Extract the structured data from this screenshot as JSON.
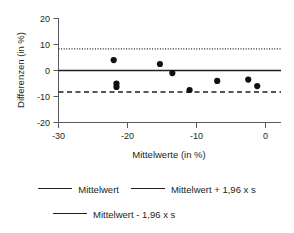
{
  "chart_data": {
    "type": "scatter",
    "title": "",
    "xlabel": "Mittelwerte (in %)",
    "ylabel": "Differenzen (in %)",
    "xlim": [
      -30,
      2
    ],
    "ylim": [
      -20,
      20
    ],
    "xticks": [
      "-30",
      "-20",
      "-10",
      "0"
    ],
    "xtick_values": [
      -30,
      -20,
      -10,
      0
    ],
    "yticks": [
      "20",
      "10",
      "0",
      "-10",
      "-20"
    ],
    "ytick_values": [
      20,
      10,
      0,
      -10,
      -20
    ],
    "grid": false,
    "legend_position": "bottom",
    "points": [
      {
        "x": -22.0,
        "y": 4.0
      },
      {
        "x": -21.6,
        "y": -5.0
      },
      {
        "x": -21.6,
        "y": -6.3
      },
      {
        "x": -15.3,
        "y": 2.5
      },
      {
        "x": -13.5,
        "y": -1.0
      },
      {
        "x": -11.0,
        "y": -7.5
      },
      {
        "x": -7.0,
        "y": -4.0
      },
      {
        "x": -2.5,
        "y": -3.5
      },
      {
        "x": -1.2,
        "y": -6.0
      }
    ],
    "reference_lines": [
      {
        "name": "mean",
        "value": 0.0,
        "style": "solid",
        "label": "Mittelwert"
      },
      {
        "name": "upper_limit",
        "value": 8.3,
        "style": "dotted",
        "label": "Mittelwert + 1,96 x s"
      },
      {
        "name": "lower_limit",
        "value": -8.3,
        "style": "dashed",
        "label": "Mittelwert - 1,96 x s"
      }
    ],
    "colors": {
      "point": "#111111",
      "line": "#231f20",
      "axis": "#58595b",
      "background": "#ffffff"
    }
  },
  "legend": {
    "items": [
      {
        "label": "Mittelwert",
        "style": "solid"
      },
      {
        "label": "Mittelwert + 1,96 x s",
        "style": "dotted"
      },
      {
        "label": "Mittelwert - 1,96 x s",
        "style": "dashed"
      }
    ]
  },
  "axes": {
    "x_title": "Mittelwerte (in %)",
    "y_title": "Differenzen (in %)",
    "x_tick_labels": [
      "-30",
      "-20",
      "-10",
      "0"
    ],
    "y_tick_labels": [
      "20",
      "10",
      "0",
      "-10",
      "-20"
    ]
  }
}
